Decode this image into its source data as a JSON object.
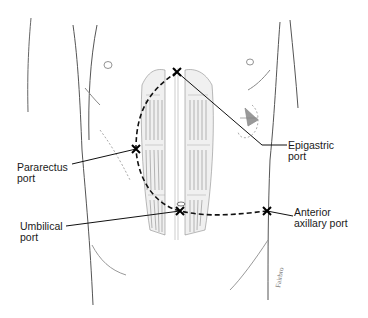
{
  "figure": {
    "labels": {
      "epigastric": {
        "line1": "Epigastric",
        "line2": "port"
      },
      "pararectus": {
        "line1": "Pararectus",
        "line2": "port"
      },
      "umbilical": {
        "line1": "Umbilical",
        "line2": "port"
      },
      "anterior_axillary": {
        "line1": "Anterior",
        "line2": "axillary port"
      }
    },
    "ports": [
      {
        "name": "Epigastric port",
        "x": 177,
        "y": 72
      },
      {
        "name": "Pararectus port",
        "x": 136,
        "y": 149
      },
      {
        "name": "Umbilical port",
        "x": 180,
        "y": 211
      },
      {
        "name": "Anterior axillary port",
        "x": 267,
        "y": 211
      }
    ],
    "colors": {
      "ink": "#1a1a1a",
      "sketch": "#8a8a8a",
      "background": "#ffffff"
    }
  }
}
